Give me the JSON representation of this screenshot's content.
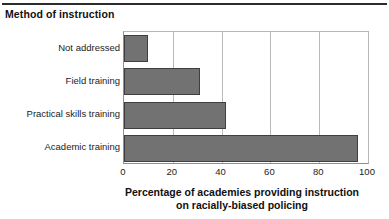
{
  "panel": {
    "title": "Method of instruction"
  },
  "chart_data": {
    "type": "bar",
    "orientation": "horizontal",
    "title": "",
    "subtitle": "",
    "categories": [
      "Not addressed",
      "Field training",
      "Practical skills training",
      "Academic training"
    ],
    "values": [
      10,
      31,
      42,
      96
    ],
    "series": [
      {
        "name": "Percentage of academies providing instruction on racially-biased policing",
        "values": [
          10,
          31,
          42,
          96
        ]
      }
    ],
    "xlabel_lines": [
      "Percentage of academies providing instruction",
      "on racially-biased policing"
    ],
    "xlabel": "Percentage of academies providing instruction on racially-biased policing",
    "ylabel": "Method of instruction",
    "xlim": [
      0,
      100
    ],
    "xticks": [
      0,
      20,
      40,
      60,
      80,
      100
    ],
    "xtick_labels": [
      "0",
      "20",
      "40",
      "60",
      "80",
      "100"
    ],
    "gridlines": [
      20,
      40,
      60,
      80
    ],
    "grid": "vertical-only",
    "legend": "none",
    "bar_color": "#727272",
    "bar_border_color": "#3f3f3f",
    "grid_color": "#b9b9b9",
    "axis_color": "#8f8f8f",
    "rule_color": "#2b2b2b"
  }
}
